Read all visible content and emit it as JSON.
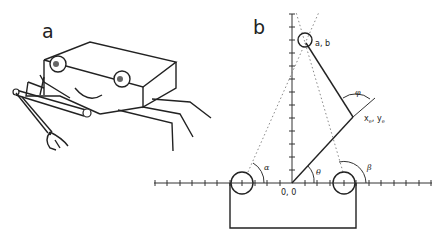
{
  "figure": {
    "panel_a": {
      "label": "a",
      "description": "Cartoon of a box-shaped robot with two eyes, a smile, legs and a gripper arm"
    },
    "panel_b": {
      "label": "b",
      "labels": {
        "origin": "0, 0",
        "target": "a, b",
        "end_effector": "x",
        "end_effector_sub": "e",
        "end_effector_sep": ", y",
        "end_effector_sub2": "e",
        "alpha": "α",
        "beta": "β",
        "theta": "θ",
        "phi": "φ"
      },
      "axes": {
        "x_ticks": 24,
        "y_ticks": 13
      }
    }
  }
}
